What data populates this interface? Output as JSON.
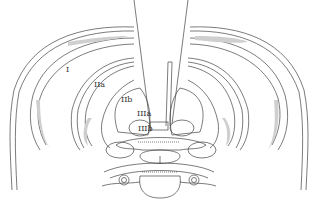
{
  "diagram": {
    "type": "anatomical-cross-section",
    "colors": {
      "line": "#444444",
      "shade": "#cfcfcf",
      "background": "#ffffff"
    },
    "labels": [
      {
        "id": "I",
        "text": "I",
        "x": 66,
        "y": 66
      },
      {
        "id": "IIa",
        "text": "IIa",
        "x": 94,
        "y": 81
      },
      {
        "id": "IIb",
        "text": "IIb",
        "x": 121,
        "y": 96
      },
      {
        "id": "IIIa",
        "text": "IIIa",
        "x": 137,
        "y": 110
      },
      {
        "id": "IIIb",
        "text": "IIIb",
        "x": 138,
        "y": 125
      }
    ]
  }
}
